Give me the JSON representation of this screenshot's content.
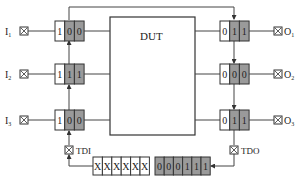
{
  "diagram": {
    "dut_label": "DUT",
    "colors": {
      "line": "#444444",
      "cell_white": "#ffffff",
      "cell_gray": "#9a9a9a",
      "text": "#222222"
    },
    "inputs": [
      {
        "label": "I",
        "sub": "1",
        "bits": [
          "1",
          "0",
          "0"
        ]
      },
      {
        "label": "I",
        "sub": "2",
        "bits": [
          "1",
          "1",
          "1"
        ]
      },
      {
        "label": "I",
        "sub": "3",
        "bits": [
          "1",
          "0",
          "0"
        ]
      }
    ],
    "outputs": [
      {
        "label": "O",
        "sub": "1",
        "bits": [
          "0",
          "1",
          "1"
        ]
      },
      {
        "label": "O",
        "sub": "2",
        "bits": [
          "0",
          "0",
          "0"
        ]
      },
      {
        "label": "O",
        "sub": "3",
        "bits": [
          "0",
          "1",
          "1"
        ]
      }
    ],
    "tdi_label": "TDI",
    "tdo_label": "TDO",
    "tdi_register": [
      "X",
      "X",
      "X",
      "X",
      "X",
      "X"
    ],
    "tdo_register": [
      "0",
      "0",
      "0",
      "1",
      "1",
      "1"
    ]
  }
}
